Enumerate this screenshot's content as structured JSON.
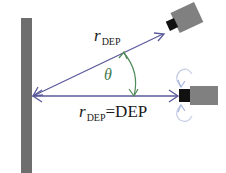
{
  "diagram": {
    "labels": {
      "upper_beam_symbol": "r",
      "upper_beam_subscript": "DEP",
      "lower_beam_symbol": "r",
      "lower_beam_subscript": "DEP",
      "lower_beam_value": "=DEP",
      "angle": "θ"
    },
    "elements": {
      "wall": "vertical-surface",
      "upper_sensor": "tilted-range-sensor",
      "lower_sensor": "horizontal-range-sensor",
      "angle_arc": "double-headed-arc",
      "rotation_indicator": "rotation-arrows"
    },
    "colors": {
      "wall": "#6e6e6e",
      "beam": "#5a5a9a",
      "angle_arc": "#4f8a5a",
      "sensor_body": "#808080",
      "sensor_lens": "#111111",
      "rotation": "#b8c4e0"
    }
  }
}
